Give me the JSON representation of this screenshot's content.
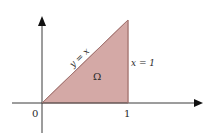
{
  "diagram": {
    "colors": {
      "background": "#ffffff",
      "axis": "#3a3a3a",
      "region_fill": "#d4a9a6",
      "region_edge": "#b98a87",
      "text": "#2a2a2a"
    },
    "axes": {
      "origin_label": "0",
      "x_tick_label": "1"
    },
    "region": {
      "label": "Ω",
      "vertices": [
        [
          0,
          0
        ],
        [
          1,
          1
        ],
        [
          1,
          0
        ]
      ]
    },
    "curves": {
      "diagonal_label": "y = x",
      "vertical_label": "x = 1"
    }
  }
}
